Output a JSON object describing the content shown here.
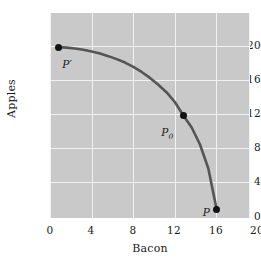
{
  "chart_data": {
    "type": "line",
    "title": "",
    "subtitle": "",
    "xlabel": "Bacon",
    "ylabel": "Apples",
    "xlim": [
      0,
      24
    ],
    "ylim": [
      0,
      24
    ],
    "xticks": [
      0,
      4,
      8,
      12,
      16,
      20
    ],
    "yticks": [
      0,
      4,
      8,
      12,
      16,
      20
    ],
    "xtick_labels": [
      "0",
      "4",
      "8",
      "12",
      "16",
      "20"
    ],
    "ytick_labels": [
      "0",
      "4",
      "8",
      "12",
      "16",
      "20"
    ],
    "grid": true,
    "grid_color": "#f2f2f2",
    "panel_color": "#c9c9c9",
    "legend": null,
    "series": [
      {
        "name": "production-possibility-frontier",
        "color": "#555555",
        "linewidth": 2.6,
        "x": [
          1.0,
          2.0,
          3.0,
          4.0,
          5.0,
          6.0,
          7.0,
          8.0,
          9.0,
          10.0,
          11.0,
          12.0,
          13.0,
          14.0,
          15.0,
          16.0,
          17.0,
          18.0,
          19.0,
          20.0
        ],
        "y": [
          20.0,
          19.95,
          19.85,
          19.7,
          19.5,
          19.25,
          18.95,
          18.6,
          18.2,
          17.7,
          17.1,
          16.4,
          15.6,
          14.7,
          13.55,
          12.0,
          10.6,
          8.6,
          5.8,
          1.0
        ]
      }
    ],
    "annotations": [
      {
        "label": "P'",
        "label_html": "P&prime;",
        "x": 1,
        "y": 20,
        "marker": true,
        "label_dx": 4,
        "label_dy": 12
      },
      {
        "label": "P0",
        "label_html": "P<sub>0</sub>",
        "x": 16,
        "y": 12,
        "marker": true,
        "label_dx": -22,
        "label_dy": 11
      },
      {
        "label": "P",
        "label_html": "P",
        "x": 20,
        "y": 1,
        "marker": true,
        "label_dx": -14,
        "label_dy": -2
      }
    ]
  },
  "figure": {
    "background": "#ffffff",
    "axis_title_x": "Bacon",
    "axis_title_y": "Apples"
  }
}
